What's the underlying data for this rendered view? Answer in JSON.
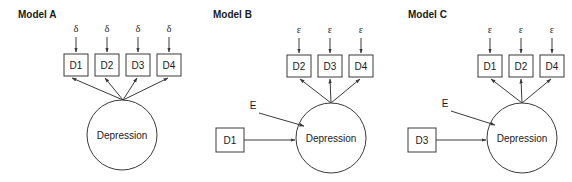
{
  "figure": {
    "type": "path-diagram",
    "background_color": "#ffffff",
    "stroke_color": "#3a3a3a",
    "text_color": "#1a1a1a"
  },
  "models": [
    {
      "id": "model-a",
      "title": "Model A",
      "latent": {
        "label": "Depression",
        "shape": "circle"
      },
      "indicators": [
        {
          "label": "D1",
          "error_label": "δ"
        },
        {
          "label": "D2",
          "error_label": "δ"
        },
        {
          "label": "D3",
          "error_label": "δ"
        },
        {
          "label": "D4",
          "error_label": "δ"
        }
      ],
      "predictor": null,
      "disturbance_label": null
    },
    {
      "id": "model-b",
      "title": "Model B",
      "latent": {
        "label": "Depression",
        "shape": "circle"
      },
      "indicators": [
        {
          "label": "D2",
          "error_label": "ε"
        },
        {
          "label": "D3",
          "error_label": "ε"
        },
        {
          "label": "D4",
          "error_label": "ε"
        }
      ],
      "predictor": {
        "label": "D1",
        "shape": "square"
      },
      "disturbance_label": "E"
    },
    {
      "id": "model-c",
      "title": "Model C",
      "latent": {
        "label": "Depression",
        "shape": "circle"
      },
      "indicators": [
        {
          "label": "D1",
          "error_label": "ε"
        },
        {
          "label": "D2",
          "error_label": "ε"
        },
        {
          "label": "D4",
          "error_label": "ε"
        }
      ],
      "predictor": {
        "label": "D3",
        "shape": "square"
      },
      "disturbance_label": "E"
    }
  ]
}
